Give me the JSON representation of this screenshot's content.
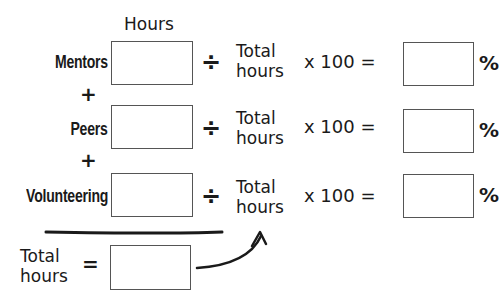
{
  "header": {
    "hours_label": "Hours"
  },
  "rows": [
    {
      "label": "Mentors",
      "hours_value": "",
      "divide_symbol": "÷",
      "divisor_line1": "Total",
      "divisor_line2": "hours",
      "multiplier": "x 100 =",
      "result_value": "",
      "percent_symbol": "%"
    },
    {
      "label": "Peers",
      "hours_value": "",
      "divide_symbol": "÷",
      "divisor_line1": "Total",
      "divisor_line2": "hours",
      "multiplier": "x 100 =",
      "result_value": "",
      "percent_symbol": "%"
    },
    {
      "label": "Volunteering",
      "hours_value": "",
      "divide_symbol": "÷",
      "divisor_line1": "Total",
      "divisor_line2": "hours",
      "multiplier": "x 100 =",
      "result_value": "",
      "percent_symbol": "%"
    }
  ],
  "operators": {
    "plus": "+"
  },
  "total": {
    "label_line1": "Total",
    "label_line2": "hours",
    "equals": "=",
    "value": ""
  }
}
